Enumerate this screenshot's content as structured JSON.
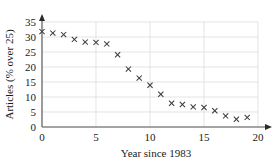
{
  "chart_data": {
    "type": "scatter",
    "title": "",
    "xlabel": "Year since 1983",
    "ylabel": "Articles (% over 25)",
    "xlim": [
      0,
      20
    ],
    "ylim": [
      0,
      35
    ],
    "xticks": [
      0,
      5,
      10,
      15,
      20
    ],
    "yticks": [
      0,
      5,
      10,
      15,
      20,
      25,
      30,
      35
    ],
    "xtick_labels": [
      "0",
      "5",
      "10",
      "15",
      "20"
    ],
    "ytick_labels": [
      "0",
      "5",
      "10",
      "15",
      "20",
      "25",
      "30",
      "35"
    ],
    "grid": true,
    "grid_axis": "both",
    "legend": false,
    "marker": "x",
    "marker_color": "#3a3a3a",
    "x": [
      0,
      1,
      2,
      3,
      4,
      5,
      6,
      7,
      8,
      9,
      10,
      11,
      12,
      13,
      14,
      15,
      16,
      17,
      18,
      19
    ],
    "values": [
      31.8,
      31.3,
      30.8,
      29.2,
      28.3,
      28.2,
      27.7,
      24.1,
      19.3,
      16.3,
      13.9,
      10.9,
      7.9,
      7.5,
      6.7,
      6.5,
      5.4,
      3.7,
      2.6,
      3.2
    ],
    "points": [
      {
        "x": 0,
        "y": 31.8
      },
      {
        "x": 1,
        "y": 31.3
      },
      {
        "x": 2,
        "y": 30.8
      },
      {
        "x": 3,
        "y": 29.2
      },
      {
        "x": 4,
        "y": 28.3
      },
      {
        "x": 5,
        "y": 28.2
      },
      {
        "x": 6,
        "y": 27.7
      },
      {
        "x": 7,
        "y": 24.1
      },
      {
        "x": 8,
        "y": 19.3
      },
      {
        "x": 9,
        "y": 16.3
      },
      {
        "x": 10,
        "y": 13.9
      },
      {
        "x": 11,
        "y": 10.9
      },
      {
        "x": 12,
        "y": 7.9
      },
      {
        "x": 13,
        "y": 7.5
      },
      {
        "x": 14,
        "y": 6.7
      },
      {
        "x": 15,
        "y": 6.5
      },
      {
        "x": 16,
        "y": 5.4
      },
      {
        "x": 17,
        "y": 3.7
      },
      {
        "x": 18,
        "y": 2.6
      },
      {
        "x": 19,
        "y": 3.2
      }
    ]
  }
}
